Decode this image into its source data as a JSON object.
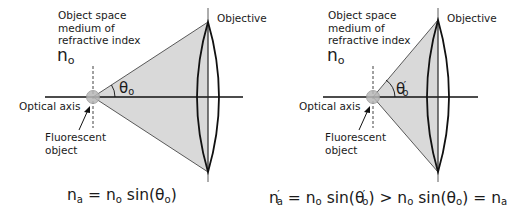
{
  "panels": [
    {
      "id": "low-na",
      "medium_label_lines": [
        "Object space",
        "medium of",
        "refractive index"
      ],
      "medium_symbol": "n",
      "medium_symbol_sub": "o",
      "objective_label": "Objective",
      "axis_label": "Optical axis",
      "object_label_lines": [
        "Fluorescent",
        "object"
      ],
      "angle_symbol": "θ",
      "angle_sub": "o",
      "angle_prime": "",
      "formula": {
        "lhs": "n",
        "lhs_sub": "a",
        "lhs_prime": "",
        "eq": "=",
        "rhs": "n",
        "rhs_sub": "o",
        "fn": "sin(",
        "arg": "θ",
        "arg_sub": "o",
        "arg_prime": "",
        "close": ")"
      }
    },
    {
      "id": "high-na",
      "medium_label_lines": [
        "Object space",
        "medium of",
        "refractive index"
      ],
      "medium_symbol": "n",
      "medium_symbol_sub": "o",
      "objective_label": "Objective",
      "axis_label": "Optical axis",
      "object_label_lines": [
        "Fluorescent",
        "object"
      ],
      "angle_symbol": "θ",
      "angle_sub": "o",
      "angle_prime": "′",
      "formula": {
        "lhs": "n",
        "lhs_sub": "a",
        "lhs_prime": "′",
        "eq": "=",
        "rhs": "n",
        "rhs_sub": "o",
        "fn": "sin(",
        "arg": "θ",
        "arg_sub": "o",
        "arg_prime": "′",
        "close": ")",
        "gt": ">",
        "rhs2": "n",
        "rhs2_sub": "o",
        "fn2": "sin(",
        "arg2": "θ",
        "arg2_sub": "o",
        "close2": ")",
        "eq2": "=",
        "end": "n",
        "end_sub": "a"
      }
    }
  ],
  "colors": {
    "cone_fill": "#d9d9d9",
    "line": "#111111",
    "object_fill": "#b8b8b8"
  }
}
